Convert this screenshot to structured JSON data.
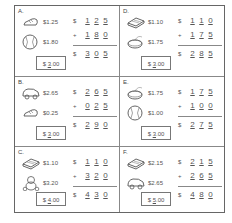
{
  "worksheet": {
    "problems": [
      {
        "letter": "A.",
        "items": [
          {
            "icon": "sneaker-icon",
            "price": "$1.25"
          },
          {
            "icon": "baseball-icon",
            "price": "$1.80"
          }
        ],
        "addend1": {
          "sign": "$",
          "digits": [
            "1",
            "2",
            "5"
          ]
        },
        "addend2": {
          "sign": "+",
          "digits": [
            "1",
            "8",
            "0"
          ]
        },
        "total": {
          "sign": "$",
          "digits": [
            "3",
            "0",
            "5"
          ]
        },
        "paid": {
          "prefix": "$",
          "dollars": "3",
          "cents": ".00"
        }
      },
      {
        "letter": "B.",
        "items": [
          {
            "icon": "toy-car-icon",
            "price": "$2.65"
          },
          {
            "icon": "sneaker-icon",
            "price": "$0.25"
          }
        ],
        "addend1": {
          "sign": "$",
          "digits": [
            "2",
            "6",
            "5"
          ]
        },
        "addend2": {
          "sign": "+",
          "digits": [
            "0",
            "2",
            "5"
          ]
        },
        "total": {
          "sign": "$",
          "digits": [
            "2",
            "9",
            "0"
          ]
        },
        "paid": {
          "prefix": "$",
          "dollars": "3",
          "cents": ".00"
        }
      },
      {
        "letter": "C.",
        "items": [
          {
            "icon": "book-icon",
            "price": "$1.10"
          },
          {
            "icon": "teddy-bear-icon",
            "price": "$3.20"
          }
        ],
        "addend1": {
          "sign": "$",
          "digits": [
            "1",
            "1",
            "0"
          ]
        },
        "addend2": {
          "sign": "+",
          "digits": [
            "3",
            "2",
            "0"
          ]
        },
        "total": {
          "sign": "$",
          "digits": [
            "4",
            "3",
            "0"
          ]
        },
        "paid": {
          "prefix": "$",
          "dollars": "4",
          "cents": ".00"
        }
      },
      {
        "letter": "D.",
        "items": [
          {
            "icon": "book-icon",
            "price": "$1.10"
          },
          {
            "icon": "yo-yo-icon",
            "price": "$1.75"
          }
        ],
        "addend1": {
          "sign": "$",
          "digits": [
            "1",
            "1",
            "0"
          ]
        },
        "addend2": {
          "sign": "+",
          "digits": [
            "1",
            "7",
            "5"
          ]
        },
        "total": {
          "sign": "$",
          "digits": [
            "2",
            "8",
            "5"
          ]
        },
        "paid": {
          "prefix": "$",
          "dollars": "3",
          "cents": ".00"
        }
      },
      {
        "letter": "E.",
        "items": [
          {
            "icon": "yo-yo-icon",
            "price": "$1.75"
          },
          {
            "icon": "baseball-icon",
            "price": "$1.00"
          }
        ],
        "addend1": {
          "sign": "$",
          "digits": [
            "1",
            "7",
            "5"
          ]
        },
        "addend2": {
          "sign": "+",
          "digits": [
            "1",
            "0",
            "0"
          ]
        },
        "total": {
          "sign": "$",
          "digits": [
            "2",
            "7",
            "5"
          ]
        },
        "paid": {
          "prefix": "$",
          "dollars": "3",
          "cents": ".00"
        }
      },
      {
        "letter": "F.",
        "items": [
          {
            "icon": "book-icon",
            "price": "$2.15"
          },
          {
            "icon": "toy-car-icon",
            "price": "$2.65"
          }
        ],
        "addend1": {
          "sign": "$",
          "digits": [
            "2",
            "1",
            "5"
          ]
        },
        "addend2": {
          "sign": "+",
          "digits": [
            "2",
            "6",
            "5"
          ]
        },
        "total": {
          "sign": "$",
          "digits": [
            "4",
            "8",
            "0"
          ]
        },
        "paid": {
          "prefix": "$",
          "dollars": "5",
          "cents": ".00"
        }
      }
    ]
  }
}
